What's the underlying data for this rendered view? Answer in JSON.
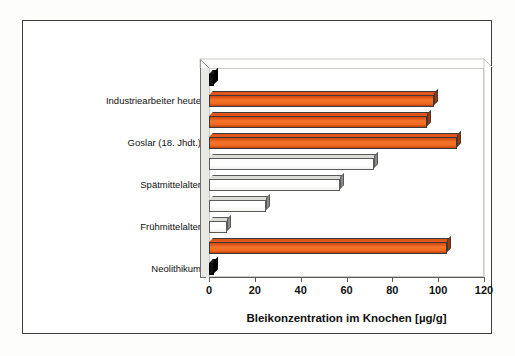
{
  "chart_data": {
    "type": "bar",
    "orientation": "horizontal",
    "title": "",
    "xlabel": "Bleikonzentration im Knochen [µg/g]",
    "ylabel": "",
    "xlim": [
      0,
      120
    ],
    "xticks": [
      0,
      20,
      40,
      60,
      80,
      100,
      120
    ],
    "xtick_labels": [
      "0",
      "20",
      "40",
      "60",
      "80",
      "100",
      "120"
    ],
    "grid": false,
    "legend": null,
    "category_labels": [
      "Industriearbeiter heute",
      "Goslar (18. Jhdt.)",
      "Spätmittelalter",
      "Frühmittelalter",
      "Neolithikum"
    ],
    "bars": [
      {
        "label": "",
        "value": 2,
        "color": "#111111",
        "style": "black"
      },
      {
        "label": "Industriearbeiter heute",
        "value": 98,
        "color": "#ef6a1e",
        "style": "orange"
      },
      {
        "label": "",
        "value": 95,
        "color": "#ef6a1e",
        "style": "orange"
      },
      {
        "label": "Goslar (18. Jhdt.)",
        "value": 108,
        "color": "#ef6a1e",
        "style": "orange"
      },
      {
        "label": "",
        "value": 72,
        "color": "#ffffff",
        "style": "white"
      },
      {
        "label": "Spätmittelalter",
        "value": 57,
        "color": "#ffffff",
        "style": "white"
      },
      {
        "label": "",
        "value": 25,
        "color": "#ffffff",
        "style": "white"
      },
      {
        "label": "Frühmittelalter",
        "value": 8,
        "color": "#ffffff",
        "style": "white"
      },
      {
        "label": "",
        "value": 104,
        "color": "#ef6a1e",
        "style": "orange"
      },
      {
        "label": "Neolithikum",
        "value": 2,
        "color": "#111111",
        "style": "black"
      }
    ],
    "colors": {
      "orange_bar": "#ef6a1e",
      "white_bar": "#ffffff",
      "black_bar": "#111111",
      "frame": "#3d3d3d",
      "axis": "#5a5a5a",
      "plot_wall": "#e9e9e6"
    }
  },
  "figure": {
    "background": "#ffffff",
    "border_color": "#3d3d3d"
  }
}
